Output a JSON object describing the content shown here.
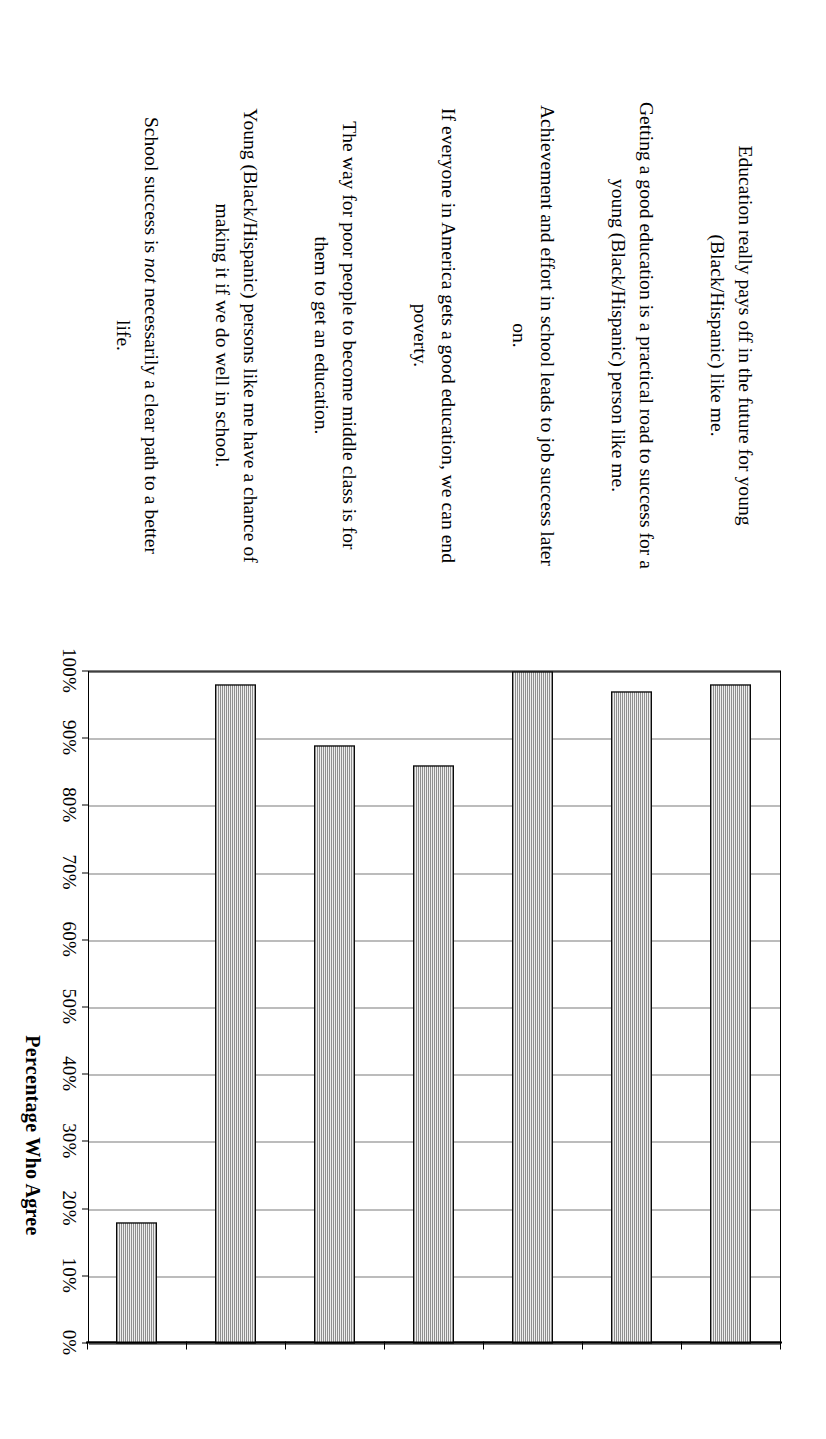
{
  "chart_data": {
    "type": "bar",
    "orientation": "rotated-90-vertical-bars",
    "title": "",
    "xlabel": "",
    "ylabel": "Percentage Who Agree",
    "ylim": [
      0,
      100
    ],
    "grid": true,
    "legend": "none",
    "categories": [
      "Education really pays off in the future for young (Black/Hispanic) like me.",
      "Getting a good education is a practical road to success for a young (Black/Hispanic) person like me.",
      "Achievement and effort in school leads to job success later on.",
      "If everyone in America gets a good education, we can end poverty.",
      "The way for poor people to become middle class is for them to get an education.",
      "Young (Black/Hispanic) persons like me have a chance of making it if we do well in school.",
      "School success is not necessarily a clear path to a better life."
    ],
    "values": [
      98,
      97,
      100,
      86,
      89,
      98,
      18
    ],
    "tick_labels": [
      "0%",
      "10%",
      "20%",
      "30%",
      "40%",
      "50%",
      "60%",
      "70%",
      "80%",
      "90%",
      "100%"
    ],
    "tick_values": [
      0,
      10,
      20,
      30,
      40,
      50,
      60,
      70,
      80,
      90,
      100
    ],
    "bar_color": "#3c3c3c",
    "bar_edge_color": "#0a0a0a",
    "gridline_color": "#7a7a7a",
    "axis_color": "#000000",
    "background_color": "#ffffff"
  },
  "axis": {
    "value_axis_title": "Percentage Who Agree"
  },
  "labels": {
    "items": [
      {
        "pre": "Education really pays off in the future for young (Black/Hispanic) like me.",
        "em": "",
        "post": ""
      },
      {
        "pre": "Getting a good education is a practical road to success for a young (Black/Hispanic) person like me.",
        "em": "",
        "post": ""
      },
      {
        "pre": "Achievement and effort in school leads to job success later on.",
        "em": "",
        "post": ""
      },
      {
        "pre": "If everyone in America gets a good education, we can end poverty.",
        "em": "",
        "post": ""
      },
      {
        "pre": "The way for poor people to become middle class is for them to get an education.",
        "em": "",
        "post": ""
      },
      {
        "pre": "Young (Black/Hispanic) persons like me have a chance of making it if we do well in school.",
        "em": "",
        "post": ""
      },
      {
        "pre": "School success is ",
        "em": "not",
        "post": " necessarily a clear path to a better life."
      }
    ]
  }
}
